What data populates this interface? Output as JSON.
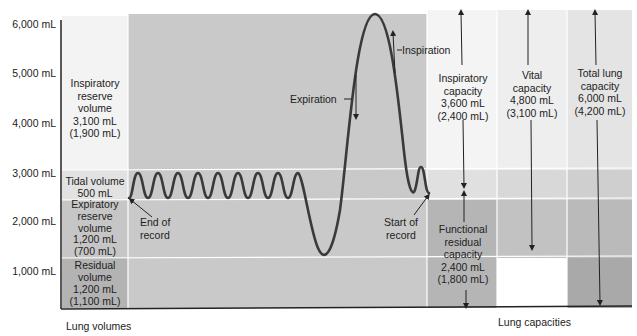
{
  "y_axis": {
    "ticks": [
      {
        "label": "6,000 mL",
        "y": 24
      },
      {
        "label": "5,000 mL",
        "y": 73
      },
      {
        "label": "4,000 mL",
        "y": 123
      },
      {
        "label": "3,000 mL",
        "y": 173
      },
      {
        "label": "2,000 mL",
        "y": 221
      },
      {
        "label": "1,000 mL",
        "y": 271
      }
    ]
  },
  "volumes": {
    "irv": {
      "lines": [
        "Inspiratory",
        "reserve",
        "volume",
        "3,100 mL",
        "(1,900 mL)"
      ]
    },
    "tv": {
      "lines": [
        "Tidal volume",
        "500 mL"
      ]
    },
    "erv": {
      "lines": [
        "Expiratory",
        "reserve",
        "volume",
        "1,200 mL",
        "(700 mL)"
      ]
    },
    "rv": {
      "lines": [
        "Residual",
        "volume",
        "1,200 mL",
        "(1,100 mL)"
      ]
    }
  },
  "capacities": {
    "ic": {
      "lines": [
        "Inspiratory",
        "capacity",
        "3,600 mL",
        "(2,400 mL)"
      ]
    },
    "vc": {
      "lines": [
        "Vital",
        "capacity",
        "4,800 mL",
        "(3,100 mL)"
      ]
    },
    "tlc": {
      "lines": [
        "Total lung",
        "capacity",
        "6,000 mL",
        "(4,200 mL)"
      ]
    },
    "frc": {
      "lines": [
        "Functional",
        "residual",
        "capacity",
        "2,400 mL",
        "(1,800 mL)"
      ]
    }
  },
  "annotations": {
    "end_of_record": [
      "End of",
      "record"
    ],
    "start_of_record": [
      "Start of",
      "record"
    ],
    "expiration": "Expiration",
    "inspiration": "Inspiration"
  },
  "captions": {
    "left": "Lung volumes",
    "right": "Lung capacities"
  },
  "colors": {
    "white": "#ffffff",
    "light": "#e9e9e9",
    "lighter": "#f1f1f1",
    "mid": "#cfcfcf",
    "graph": "#c8c8c8",
    "dark": "#b0b0b0",
    "darker": "#a6a6a6",
    "trace": "#3a3a3a"
  }
}
